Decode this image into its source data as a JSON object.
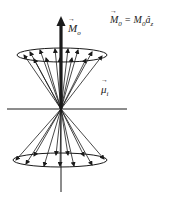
{
  "diagram": {
    "type": "precession-cone",
    "labels": {
      "equation": {
        "lhs_symbol": "M",
        "lhs_sub": "0",
        "equals": "=",
        "rhs_symbol": "M",
        "rhs_sub": "0",
        "unit_vector": "â",
        "unit_sub": "z"
      },
      "net_magnetization": {
        "symbol": "M",
        "sub": "o"
      },
      "spin_moment": {
        "symbol": "μ",
        "sub": "i"
      }
    },
    "colors": {
      "stroke": "#1a1a1a",
      "background": "#ffffff"
    },
    "geometry": {
      "origin": [
        61,
        109
      ],
      "horizontal_axis": {
        "x1": 7,
        "x2": 127,
        "y": 109
      },
      "vertical_axis": {
        "x": 61,
        "y1": 109,
        "y2": 192
      },
      "net_arrow_tip": [
        61,
        16
      ],
      "top_cone": {
        "cx": 62,
        "cy": 55,
        "rx": 45,
        "ry": 7
      },
      "bottom_cone": {
        "cx": 60,
        "cy": 160,
        "rx": 47,
        "ry": 7
      }
    },
    "top_vectors": [
      [
        24,
        55
      ],
      [
        30,
        52
      ],
      [
        34,
        59
      ],
      [
        40,
        50
      ],
      [
        46,
        58
      ],
      [
        55,
        49
      ],
      [
        60,
        58
      ],
      [
        68,
        49
      ],
      [
        72,
        58
      ],
      [
        78,
        50
      ],
      [
        86,
        59
      ],
      [
        92,
        52
      ],
      [
        102,
        56
      ]
    ],
    "bottom_vectors": [
      [
        16,
        160
      ],
      [
        26,
        164
      ],
      [
        34,
        156
      ],
      [
        44,
        166
      ],
      [
        56,
        155
      ],
      [
        60,
        166
      ],
      [
        68,
        155
      ],
      [
        74,
        166
      ],
      [
        84,
        156
      ],
      [
        92,
        165
      ],
      [
        104,
        159
      ]
    ]
  }
}
